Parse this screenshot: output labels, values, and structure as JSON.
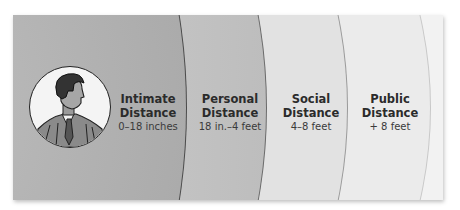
{
  "diagram": {
    "zones": [
      {
        "name": "Intimate",
        "title": "Intimate",
        "subtitle": "Distance",
        "range": "0–18 inches"
      },
      {
        "name": "Personal",
        "title": "Personal",
        "subtitle": "Distance",
        "range": "18 in.–4 feet"
      },
      {
        "name": "Social",
        "title": "Social",
        "subtitle": "Distance",
        "range": "4–8 feet"
      },
      {
        "name": "Public",
        "title": "Public",
        "subtitle": "Distance",
        "range": "+ 8 feet"
      }
    ],
    "center_icon": "businessman-portrait-icon",
    "colors": {
      "intimate": "#a9a9a9",
      "personal": "#c4c4c4",
      "social": "#e2e2e2",
      "public": "#ebebeb"
    }
  }
}
